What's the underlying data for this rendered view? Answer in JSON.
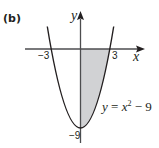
{
  "figure": {
    "panel_label": "(b)",
    "x_axis_label": "x",
    "y_axis_label": "y",
    "tick_labels": {
      "x_neg": "−3",
      "x_pos": "3",
      "y_min": "−9"
    },
    "equation": {
      "lhs": "y",
      "eq": " = ",
      "base": "x",
      "exp": "2",
      "rest": " − 9"
    },
    "colors": {
      "curve": "#231f20",
      "axes": "#4d4d4f",
      "shading": "#d1d2d4"
    },
    "shaded_region": "between curve and x-axis for 0 ≤ x ≤ 3"
  }
}
